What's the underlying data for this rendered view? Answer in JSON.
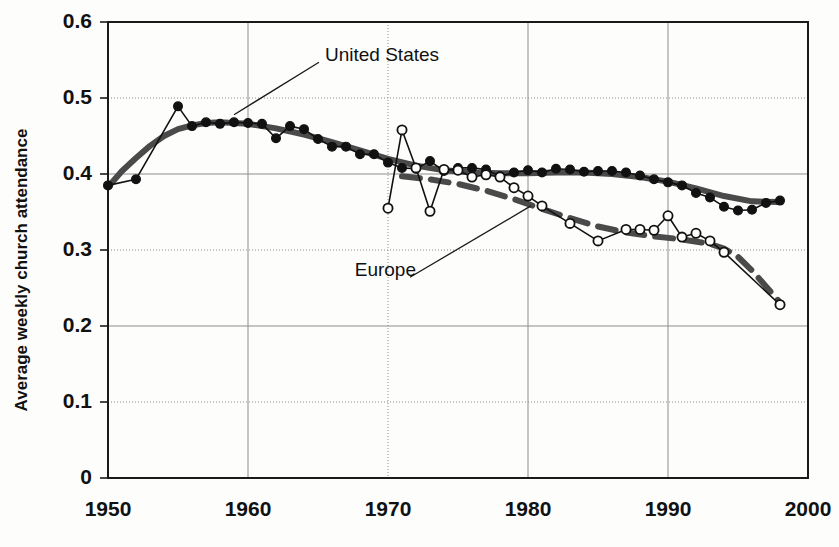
{
  "chart_data": {
    "type": "line",
    "title": "",
    "subtitle": "",
    "xlabel": "",
    "ylabel": "Average weekly church attendance",
    "xlim": [
      1950,
      2000
    ],
    "ylim": [
      0,
      0.6
    ],
    "grid": true,
    "legend_position": "inline-annotations",
    "x_ticks": [
      "1950",
      "1960",
      "1970",
      "1980",
      "1990",
      "2000"
    ],
    "x_tick_values": [
      1950,
      1960,
      1970,
      1980,
      1990,
      2000
    ],
    "y_ticks": [
      "0",
      "0.1",
      "0.2",
      "0.3",
      "0.4",
      "0.5",
      "0.6"
    ],
    "y_tick_values": [
      0,
      0.1,
      0.2,
      0.3,
      0.4,
      0.5,
      0.6
    ],
    "annotations": [
      {
        "text": "United States",
        "x": 1965.5,
        "y": 0.555,
        "leader_to_x": 1959.0,
        "leader_to_y": 0.478
      },
      {
        "text": "Europe",
        "x": 1972.0,
        "y": 0.272,
        "leader_to_x": 1980.2,
        "leader_to_y": 0.358
      }
    ],
    "series": [
      {
        "name": "United States",
        "marker": "filled-circle",
        "color": "#111111",
        "x": [
          1950,
          1952,
          1955,
          1956,
          1957,
          1958,
          1959,
          1960,
          1961,
          1962,
          1963,
          1964,
          1965,
          1966,
          1967,
          1968,
          1969,
          1970,
          1971,
          1972,
          1973,
          1974,
          1975,
          1976,
          1977,
          1978,
          1979,
          1980,
          1981,
          1982,
          1983,
          1984,
          1985,
          1986,
          1987,
          1988,
          1989,
          1990,
          1991,
          1992,
          1993,
          1994,
          1995,
          1996,
          1997,
          1998
        ],
        "values": [
          0.385,
          0.393,
          0.489,
          0.463,
          0.468,
          0.466,
          0.468,
          0.467,
          0.466,
          0.447,
          0.463,
          0.459,
          0.446,
          0.436,
          0.436,
          0.426,
          0.426,
          0.415,
          0.408,
          0.407,
          0.417,
          0.404,
          0.408,
          0.408,
          0.406,
          0.397,
          0.402,
          0.405,
          0.402,
          0.407,
          0.406,
          0.403,
          0.404,
          0.404,
          0.402,
          0.398,
          0.393,
          0.389,
          0.385,
          0.375,
          0.369,
          0.357,
          0.352,
          0.353,
          0.362,
          0.365
        ]
      },
      {
        "name": "Europe",
        "marker": "open-circle",
        "color": "#111111",
        "x": [
          1970,
          1971,
          1972,
          1973,
          1974,
          1975,
          1976,
          1977,
          1978,
          1979,
          1980,
          1981,
          1983,
          1985,
          1987,
          1988,
          1989,
          1990,
          1991,
          1992,
          1993,
          1994,
          1998
        ],
        "values": [
          0.355,
          0.458,
          0.408,
          0.351,
          0.406,
          0.405,
          0.396,
          0.399,
          0.396,
          0.382,
          0.371,
          0.358,
          0.335,
          0.312,
          0.327,
          0.327,
          0.326,
          0.345,
          0.317,
          0.322,
          0.312,
          0.297,
          0.228
        ]
      }
    ],
    "trend_lines": [
      {
        "name": "United States trend",
        "style": "solid-thick",
        "color": "#4a4a4a",
        "points": [
          {
            "x": 1950,
            "y": 0.383
          },
          {
            "x": 1951,
            "y": 0.404
          },
          {
            "x": 1952,
            "y": 0.421
          },
          {
            "x": 1953,
            "y": 0.437
          },
          {
            "x": 1954,
            "y": 0.45
          },
          {
            "x": 1955,
            "y": 0.459
          },
          {
            "x": 1956,
            "y": 0.464
          },
          {
            "x": 1957,
            "y": 0.467
          },
          {
            "x": 1958,
            "y": 0.468
          },
          {
            "x": 1960,
            "y": 0.466
          },
          {
            "x": 1962,
            "y": 0.46
          },
          {
            "x": 1964,
            "y": 0.452
          },
          {
            "x": 1966,
            "y": 0.442
          },
          {
            "x": 1968,
            "y": 0.431
          },
          {
            "x": 1970,
            "y": 0.42
          },
          {
            "x": 1972,
            "y": 0.411
          },
          {
            "x": 1974,
            "y": 0.405
          },
          {
            "x": 1976,
            "y": 0.402
          },
          {
            "x": 1978,
            "y": 0.401
          },
          {
            "x": 1980,
            "y": 0.401
          },
          {
            "x": 1982,
            "y": 0.402
          },
          {
            "x": 1984,
            "y": 0.402
          },
          {
            "x": 1986,
            "y": 0.4
          },
          {
            "x": 1988,
            "y": 0.396
          },
          {
            "x": 1990,
            "y": 0.39
          },
          {
            "x": 1992,
            "y": 0.381
          },
          {
            "x": 1994,
            "y": 0.371
          },
          {
            "x": 1996,
            "y": 0.364
          },
          {
            "x": 1998,
            "y": 0.363
          }
        ]
      },
      {
        "name": "Europe trend",
        "style": "dashed-thick",
        "color": "#4a4a4a",
        "points": [
          {
            "x": 1971,
            "y": 0.397
          },
          {
            "x": 1973,
            "y": 0.393
          },
          {
            "x": 1975,
            "y": 0.387
          },
          {
            "x": 1977,
            "y": 0.378
          },
          {
            "x": 1979,
            "y": 0.367
          },
          {
            "x": 1981,
            "y": 0.354
          },
          {
            "x": 1983,
            "y": 0.342
          },
          {
            "x": 1985,
            "y": 0.331
          },
          {
            "x": 1987,
            "y": 0.323
          },
          {
            "x": 1989,
            "y": 0.318
          },
          {
            "x": 1991,
            "y": 0.314
          },
          {
            "x": 1993,
            "y": 0.308
          },
          {
            "x": 1994,
            "y": 0.302
          },
          {
            "x": 1995,
            "y": 0.291
          },
          {
            "x": 1996,
            "y": 0.273
          },
          {
            "x": 1997,
            "y": 0.252
          },
          {
            "x": 1998,
            "y": 0.231
          }
        ]
      }
    ]
  }
}
